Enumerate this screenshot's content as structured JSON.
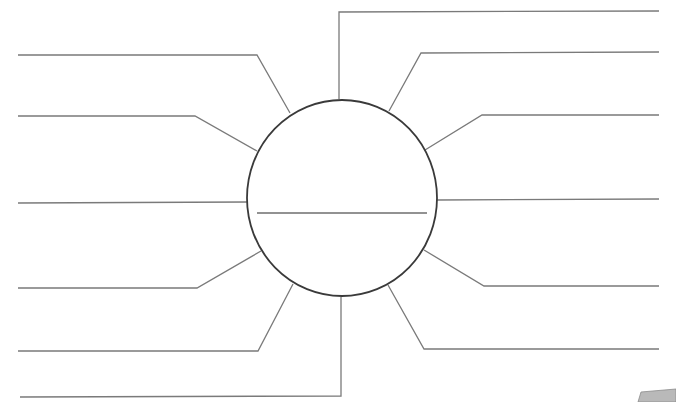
{
  "diagram": {
    "type": "spider-map-template",
    "colors": {
      "background": "#ffffff",
      "hub_stroke": "#3a3a3a",
      "spoke_stroke": "#7a7a7a",
      "divider_stroke": "#6e6e6e",
      "page_curl": "#b9b9b9"
    },
    "hub": {
      "cx": 342,
      "cy": 198,
      "rx": 95,
      "ry": 98,
      "divider": {
        "x1": 257,
        "x2": 427,
        "y": 213
      }
    },
    "spokes": [
      {
        "side": "left",
        "points": "18,55 257,55 290,113"
      },
      {
        "side": "left",
        "points": "18,116 195,116 257,151"
      },
      {
        "side": "left",
        "points": "18,203 247,202"
      },
      {
        "side": "left",
        "points": "18,288 197,288 261,251"
      },
      {
        "side": "left",
        "points": "18,351 258,351 293,284"
      },
      {
        "side": "left",
        "points": "20,397 341,396 341,297"
      },
      {
        "side": "right",
        "points": "339,99 339,12 659,11"
      },
      {
        "side": "right",
        "points": "389,111 421,53 659,52"
      },
      {
        "side": "right",
        "points": "425,150 482,115 659,115"
      },
      {
        "side": "right",
        "points": "437,200 659,199"
      },
      {
        "side": "right",
        "points": "424,250 484,286 659,286"
      },
      {
        "side": "right",
        "points": "388,285 424,349 659,349"
      }
    ],
    "page_curl": {
      "points": "641,392 676,389 676,402 638,402"
    }
  }
}
